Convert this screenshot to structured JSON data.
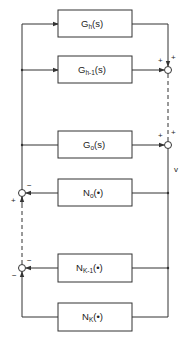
{
  "diagram": {
    "type": "block-diagram",
    "colors": {
      "line": "#333333",
      "background": "#ffffff"
    },
    "blocks": [
      {
        "id": "Gh",
        "base": "G",
        "sub": "h",
        "arg": "(s)"
      },
      {
        "id": "Gh1",
        "base": "G",
        "sub": "h-1",
        "arg": "(s)"
      },
      {
        "id": "G0",
        "base": "G",
        "sub": "o",
        "arg": "(s)"
      },
      {
        "id": "N0",
        "base": "N",
        "sub": "o",
        "arg": "(•)"
      },
      {
        "id": "NK1",
        "base": "N",
        "sub": "K-1",
        "arg": "(•)"
      },
      {
        "id": "NK",
        "base": "N",
        "sub": "K",
        "arg": "(•)"
      }
    ],
    "junctions": {
      "right_upper": {
        "sign_left": "+",
        "sign_top": "+"
      },
      "right_lower": {
        "sign_left": "+",
        "sign_top": "+"
      },
      "left_upper": {
        "sign_right": "−",
        "sign_bottom": "+"
      },
      "left_lower": {
        "sign_right": "−",
        "sign_bottom": "−"
      }
    },
    "signal_label": "v"
  }
}
